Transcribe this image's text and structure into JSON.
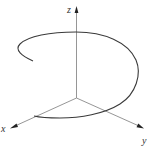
{
  "figure": {
    "type": "3d-parametric-curve"
  },
  "axes": {
    "z": {
      "label": "z"
    },
    "x": {
      "label": "x"
    },
    "y": {
      "label": "y"
    }
  },
  "colors": {
    "axis": "#8a8a8a",
    "curve": "#3a3a3a",
    "arrow": "#222222",
    "background": "#ffffff"
  }
}
